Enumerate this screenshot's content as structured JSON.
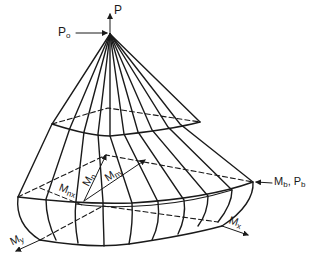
{
  "diagram": {
    "colors": {
      "line": "#1a1a1a",
      "background": "#ffffff"
    },
    "labels": {
      "P": {
        "main": "P",
        "sub": ""
      },
      "Po": {
        "main": "P",
        "sub": "o"
      },
      "MbPb": {
        "main": "M",
        "sub": "b",
        "sep": ", P",
        "sub2": "b"
      },
      "My": {
        "main": "M",
        "sub": "y"
      },
      "Mx": {
        "main": "M",
        "sub": "x"
      },
      "Mnx": {
        "main": "M",
        "sub": "nx"
      },
      "Mn": {
        "main": "M",
        "sub": "n"
      },
      "Mny": {
        "main": "M",
        "sub": "ny"
      }
    }
  }
}
